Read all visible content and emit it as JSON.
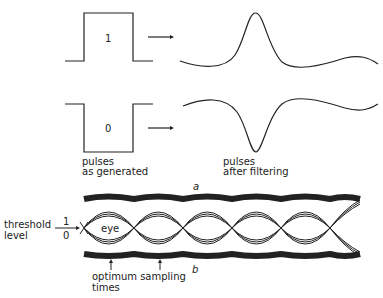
{
  "panel_a": {
    "pulse_one_label": "1",
    "pulse_zero_label": "0",
    "caption_generated_line1": "pulses",
    "caption_generated_line2": "as generated",
    "caption_filtered_line1": "pulses",
    "caption_filtered_line2": "after filtering",
    "sublabel": "a"
  },
  "panel_b": {
    "threshold_line1": "threshold",
    "threshold_line2": "level",
    "level_one": "1",
    "level_zero": "0",
    "eye_label": "eye",
    "sampling_line1": "optimum  sampling",
    "sampling_line2": "times",
    "sublabel": "b"
  }
}
